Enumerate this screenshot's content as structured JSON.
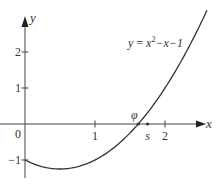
{
  "chart_data": {
    "type": "line",
    "title": "",
    "function_label": "y = x²−x−1",
    "function_label_parts": {
      "y": "y",
      "eq": " = ",
      "x": "x",
      "sup": "2",
      "rest": "−x−1"
    },
    "xlabel": "x",
    "ylabel": "y",
    "origin_label": "0",
    "xlim": [
      0,
      2.7
    ],
    "ylim": [
      -1.45,
      2.9
    ],
    "x_ticks": [
      {
        "value": 1,
        "label": "1"
      },
      {
        "value": 2,
        "label": "2"
      }
    ],
    "y_ticks": [
      {
        "value": 2,
        "label": "2"
      },
      {
        "value": 1,
        "label": "1"
      },
      {
        "value": -1,
        "label": "−1"
      }
    ],
    "series": [
      {
        "name": "y = x^2 - x - 1",
        "expression": "x*x - x - 1",
        "x_range": [
          0,
          2.6
        ]
      }
    ],
    "annotations": [
      {
        "label": "φ",
        "x": 1.618,
        "y": 0,
        "note": "root of curve"
      },
      {
        "label": "s",
        "x": 1.75,
        "y": 0,
        "note": "point on x-axis"
      }
    ],
    "grid": false
  }
}
